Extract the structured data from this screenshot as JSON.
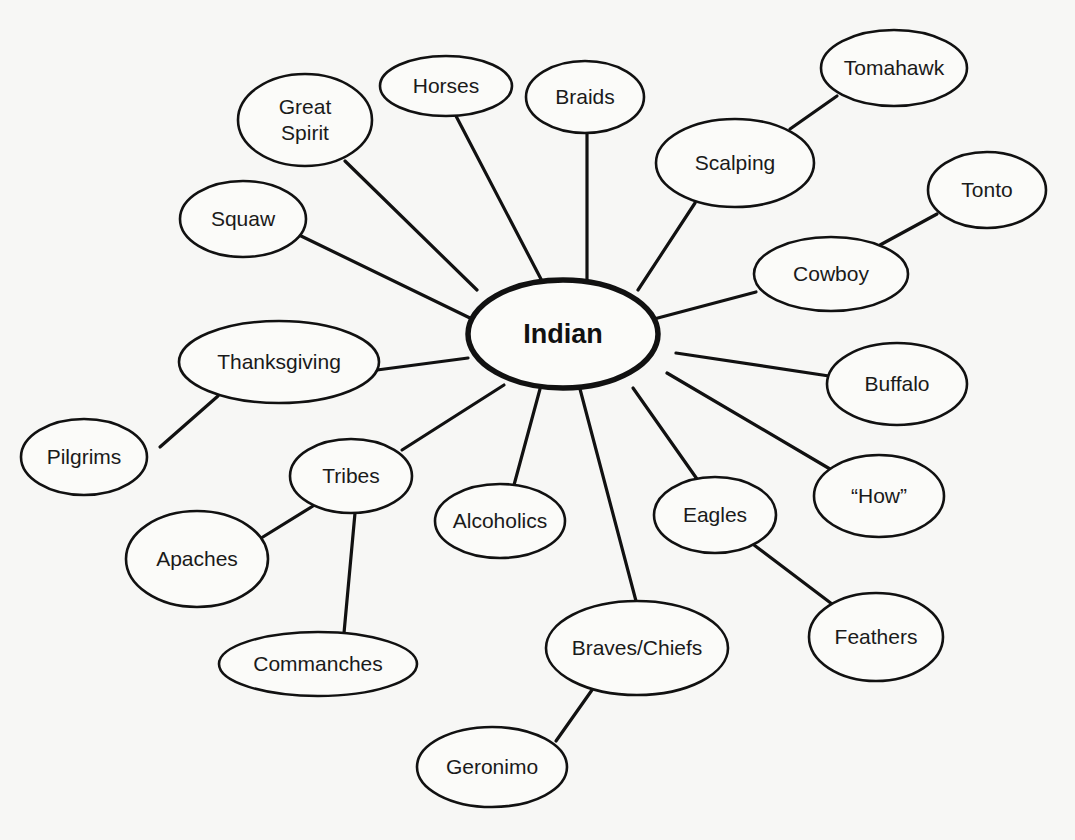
{
  "diagram": {
    "type": "concept-web",
    "top_text_fragment": "g          g",
    "center": {
      "label": "Indian",
      "cx": 563,
      "cy": 334,
      "rx": 95,
      "ry": 54
    },
    "nodes": [
      {
        "id": "great-spirit",
        "lines": [
          "Great",
          "Spirit"
        ],
        "cx": 305,
        "cy": 120,
        "rx": 67,
        "ry": 46,
        "parent": "center"
      },
      {
        "id": "horses",
        "lines": [
          "Horses"
        ],
        "cx": 446,
        "cy": 86,
        "rx": 66,
        "ry": 30,
        "parent": "center"
      },
      {
        "id": "braids",
        "lines": [
          "Braids"
        ],
        "cx": 585,
        "cy": 97,
        "rx": 59,
        "ry": 36,
        "parent": "center"
      },
      {
        "id": "scalping",
        "lines": [
          "Scalping"
        ],
        "cx": 735,
        "cy": 163,
        "rx": 79,
        "ry": 44,
        "parent": "center"
      },
      {
        "id": "tomahawk",
        "lines": [
          "Tomahawk"
        ],
        "cx": 894,
        "cy": 68,
        "rx": 73,
        "ry": 38,
        "parent": "scalping"
      },
      {
        "id": "tonto",
        "lines": [
          "Tonto"
        ],
        "cx": 987,
        "cy": 190,
        "rx": 59,
        "ry": 38,
        "parent": "cowboy"
      },
      {
        "id": "cowboy",
        "lines": [
          "Cowboy"
        ],
        "cx": 831,
        "cy": 274,
        "rx": 77,
        "ry": 37,
        "parent": "center"
      },
      {
        "id": "squaw",
        "lines": [
          "Squaw"
        ],
        "cx": 243,
        "cy": 219,
        "rx": 63,
        "ry": 38,
        "parent": "center"
      },
      {
        "id": "thanksgiving",
        "lines": [
          "Thanksgiving"
        ],
        "cx": 279,
        "cy": 362,
        "rx": 100,
        "ry": 41,
        "parent": "center"
      },
      {
        "id": "buffalo",
        "lines": [
          "Buffalo"
        ],
        "cx": 897,
        "cy": 384,
        "rx": 70,
        "ry": 41,
        "parent": "center"
      },
      {
        "id": "pilgrims",
        "lines": [
          "Pilgrims"
        ],
        "cx": 84,
        "cy": 457,
        "rx": 63,
        "ry": 38,
        "parent": "thanksgiving"
      },
      {
        "id": "tribes",
        "lines": [
          "Tribes"
        ],
        "cx": 351,
        "cy": 476,
        "rx": 61,
        "ry": 37,
        "parent": "center"
      },
      {
        "id": "how",
        "lines": [
          "“How”"
        ],
        "cx": 879,
        "cy": 496,
        "rx": 65,
        "ry": 41,
        "parent": "center"
      },
      {
        "id": "alcoholics",
        "lines": [
          "Alcoholics"
        ],
        "cx": 500,
        "cy": 521,
        "rx": 65,
        "ry": 37,
        "parent": "center"
      },
      {
        "id": "eagles",
        "lines": [
          "Eagles"
        ],
        "cx": 715,
        "cy": 515,
        "rx": 61,
        "ry": 38,
        "parent": "center"
      },
      {
        "id": "apaches",
        "lines": [
          "Apaches"
        ],
        "cx": 197,
        "cy": 559,
        "rx": 71,
        "ry": 48,
        "parent": "tribes"
      },
      {
        "id": "feathers",
        "lines": [
          "Feathers"
        ],
        "cx": 876,
        "cy": 637,
        "rx": 67,
        "ry": 44,
        "parent": "eagles"
      },
      {
        "id": "braves-chiefs",
        "lines": [
          "Braves/Chiefs"
        ],
        "cx": 637,
        "cy": 648,
        "rx": 91,
        "ry": 47,
        "parent": "center"
      },
      {
        "id": "commanches",
        "lines": [
          "Commanches"
        ],
        "cx": 318,
        "cy": 664,
        "rx": 99,
        "ry": 32,
        "parent": "tribes"
      },
      {
        "id": "geronimo",
        "lines": [
          "Geronimo"
        ],
        "cx": 492,
        "cy": 767,
        "rx": 75,
        "ry": 40,
        "parent": "braves-chiefs"
      }
    ],
    "edges": [
      {
        "from": "center",
        "to": "great-spirit",
        "x1": 477,
        "y1": 290,
        "x2": 345,
        "y2": 161
      },
      {
        "from": "center",
        "to": "horses",
        "x1": 542,
        "y1": 281,
        "x2": 456,
        "y2": 116
      },
      {
        "from": "center",
        "to": "braids",
        "x1": 587,
        "y1": 280,
        "x2": 587,
        "y2": 133
      },
      {
        "from": "center",
        "to": "scalping",
        "x1": 638,
        "y1": 290,
        "x2": 695,
        "y2": 203
      },
      {
        "from": "scalping",
        "to": "tomahawk",
        "x1": 790,
        "y1": 129,
        "x2": 837,
        "y2": 96
      },
      {
        "from": "center",
        "to": "squaw",
        "x1": 470,
        "y1": 318,
        "x2": 299,
        "y2": 235
      },
      {
        "from": "center",
        "to": "cowboy",
        "x1": 654,
        "y1": 319,
        "x2": 756,
        "y2": 292
      },
      {
        "from": "cowboy",
        "to": "tonto",
        "x1": 880,
        "y1": 245,
        "x2": 937,
        "y2": 214
      },
      {
        "from": "center",
        "to": "thanksgiving",
        "x1": 468,
        "y1": 358,
        "x2": 377,
        "y2": 370
      },
      {
        "from": "thanksgiving",
        "to": "pilgrims",
        "x1": 218,
        "y1": 396,
        "x2": 160,
        "y2": 447
      },
      {
        "from": "center",
        "to": "buffalo",
        "x1": 676,
        "y1": 353,
        "x2": 829,
        "y2": 376
      },
      {
        "from": "center",
        "to": "how",
        "x1": 667,
        "y1": 373,
        "x2": 830,
        "y2": 469
      },
      {
        "from": "center",
        "to": "tribes",
        "x1": 504,
        "y1": 385,
        "x2": 402,
        "y2": 450
      },
      {
        "from": "tribes",
        "to": "apaches",
        "x1": 313,
        "y1": 506,
        "x2": 258,
        "y2": 540
      },
      {
        "from": "tribes",
        "to": "commanches",
        "x1": 355,
        "y1": 513,
        "x2": 344,
        "y2": 633
      },
      {
        "from": "center",
        "to": "alcoholics",
        "x1": 540,
        "y1": 389,
        "x2": 514,
        "y2": 485
      },
      {
        "from": "center",
        "to": "eagles",
        "x1": 633,
        "y1": 388,
        "x2": 697,
        "y2": 479
      },
      {
        "from": "eagles",
        "to": "feathers",
        "x1": 754,
        "y1": 545,
        "x2": 832,
        "y2": 604
      },
      {
        "from": "center",
        "to": "braves-chiefs",
        "x1": 580,
        "y1": 389,
        "x2": 636,
        "y2": 601
      },
      {
        "from": "braves-chiefs",
        "to": "geronimo",
        "x1": 592,
        "y1": 690,
        "x2": 556,
        "y2": 741
      }
    ],
    "colors": {
      "background": "#f7f7f5",
      "stroke": "#111111",
      "text": "#1a1a1a"
    }
  }
}
